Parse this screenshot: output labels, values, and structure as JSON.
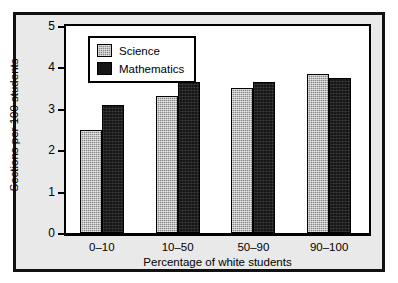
{
  "chart_data": {
    "type": "bar",
    "title": "",
    "xlabel": "Percentage of white students",
    "ylabel": "Sections per 100 students",
    "categories": [
      "0–10",
      "10–50",
      "50–90",
      "90–100"
    ],
    "series": [
      {
        "name": "Science",
        "values": [
          2.5,
          3.3,
          3.5,
          3.85
        ],
        "color": "#8a8a8a",
        "fill": "gray-checkered"
      },
      {
        "name": "Mathematics",
        "values": [
          3.1,
          3.65,
          3.65,
          3.75
        ],
        "color": "#151515",
        "fill": "solid-black"
      }
    ],
    "ylim": [
      0,
      5
    ],
    "yticks": [
      0,
      1,
      2,
      3,
      4,
      5
    ],
    "ytick_labels": [
      "0",
      "1",
      "2",
      "3",
      "4",
      "5"
    ],
    "grid": false,
    "legend_position": "top-left",
    "frame": true
  },
  "legend": {
    "entries": [
      {
        "label": "Science"
      },
      {
        "label": "Mathematics"
      }
    ]
  }
}
